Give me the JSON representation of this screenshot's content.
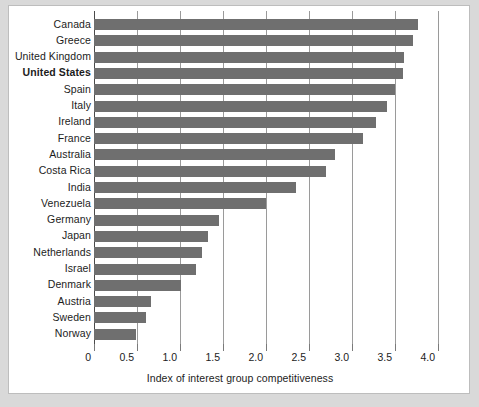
{
  "chart_data": {
    "type": "bar",
    "orientation": "horizontal",
    "title": "",
    "xlabel": "Index of interest group competitiveness",
    "ylabel": "",
    "xlim": [
      0,
      4.0
    ],
    "xticks": [
      "0",
      "0.5",
      "1.0",
      "1.5",
      "2.0",
      "2.5",
      "3.0",
      "3.5",
      "4.0"
    ],
    "xtick_values": [
      0,
      0.5,
      1.0,
      1.5,
      2.0,
      2.5,
      3.0,
      3.5,
      4.0
    ],
    "grid": "vertical",
    "legend": "none",
    "bar_color": "#6f6f6f",
    "highlight_category": "United States",
    "categories": [
      "Canada",
      "Greece",
      "United Kingdom",
      "United States",
      "Spain",
      "Italy",
      "Ireland",
      "France",
      "Australia",
      "Costa Rica",
      "India",
      "Venezuela",
      "Germany",
      "Japan",
      "Netherlands",
      "Israel",
      "Denmark",
      "Austria",
      "Sweden",
      "Norway"
    ],
    "values": [
      3.77,
      3.71,
      3.6,
      3.59,
      3.5,
      3.41,
      3.28,
      3.13,
      2.8,
      2.7,
      2.35,
      2.0,
      1.45,
      1.33,
      1.25,
      1.19,
      1.01,
      0.66,
      0.6,
      0.49
    ]
  }
}
